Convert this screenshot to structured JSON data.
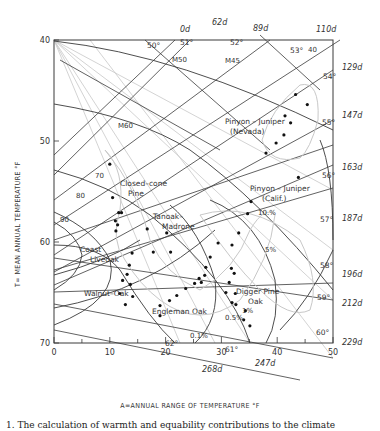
{
  "chart_data": {
    "type": "scatter",
    "title": "",
    "xlabel": "A=ANNUAL RANGE OF TEMPERATURE °F",
    "ylabel": "T= MEAN ANNUAL TEMPERATURE °F",
    "xlim": [
      0,
      50
    ],
    "ylim": [
      70,
      40
    ],
    "y_inverted": true,
    "x_ticks": [
      0,
      10,
      20,
      30,
      40,
      50
    ],
    "y_ticks": [
      40,
      50,
      60,
      70
    ],
    "grid": false,
    "legend": null,
    "series": [
      {
        "name": "Pinyon–Juniper (Nevada)",
        "points": [
          [
            43.3,
            45.4
          ],
          [
            45.4,
            46.4
          ],
          [
            41.4,
            47.5
          ],
          [
            42.4,
            48.2
          ],
          [
            41.2,
            49.4
          ],
          [
            39.8,
            50.2
          ],
          [
            38.0,
            51.2
          ],
          [
            43.8,
            53.6
          ]
        ]
      },
      {
        "name": "Closed-cone Pine",
        "points": [
          [
            10.0,
            52.3
          ],
          [
            10.5,
            55.6
          ]
        ]
      },
      {
        "name": "Coast Liveoak",
        "points": [
          [
            11.6,
            57.1
          ],
          [
            12.1,
            57.1
          ],
          [
            11.0,
            57.9
          ],
          [
            11.4,
            58.3
          ],
          [
            11.1,
            58.9
          ]
        ]
      },
      {
        "name": "Tanoak–Madrone",
        "points": [
          [
            16.7,
            58.7
          ],
          [
            20.2,
            59.1
          ],
          [
            17.8,
            61.0
          ],
          [
            20.9,
            61.0
          ],
          [
            14.0,
            61.1
          ]
        ]
      },
      {
        "name": "Walnut–Oak",
        "points": [
          [
            13.5,
            62.3
          ],
          [
            13.1,
            63.2
          ],
          [
            12.3,
            63.8
          ],
          [
            13.7,
            64.2
          ],
          [
            11.8,
            65.1
          ],
          [
            14.1,
            65.4
          ],
          [
            12.8,
            66.2
          ]
        ]
      },
      {
        "name": "Engleman Oak",
        "points": [
          [
            20.7,
            65.8
          ],
          [
            22.0,
            65.3
          ],
          [
            23.6,
            64.6
          ],
          [
            25.2,
            64.1
          ],
          [
            26.0,
            63.6
          ],
          [
            19.0,
            66.3
          ],
          [
            19.0,
            67.3
          ]
        ]
      },
      {
        "name": "Pinyon–Juniper (Calif.)",
        "points": [
          [
            35.3,
            56.0
          ],
          [
            34.7,
            57.2
          ],
          [
            33.1,
            59.1
          ],
          [
            29.4,
            60.1
          ],
          [
            31.9,
            60.3
          ],
          [
            28.0,
            61.5
          ],
          [
            27.2,
            62.5
          ],
          [
            27.0,
            63.3
          ],
          [
            26.4,
            64.0
          ]
        ]
      },
      {
        "name": "Digger Pine Oak",
        "points": [
          [
            31.8,
            62.6
          ],
          [
            32.3,
            63.1
          ],
          [
            31.4,
            64.0
          ],
          [
            30.8,
            65.0
          ],
          [
            32.5,
            65.1
          ],
          [
            31.9,
            66.0
          ],
          [
            32.6,
            66.2
          ],
          [
            34.3,
            66.8
          ],
          [
            34.0,
            67.7
          ],
          [
            35.1,
            68.3
          ]
        ]
      }
    ],
    "annotations": {
      "region_labels": [
        "Pinyon–Juniper (Nevada)",
        "Closed-cone Pine",
        "Tanoak–Madrone",
        "Pinyon–Juniper (Calif.)",
        "Coast Liveoak",
        "Walnut–Oak",
        "Engleman Oak",
        "Digger Pine Oak"
      ],
      "latitude_labels": [
        "50°",
        "51°",
        "52°",
        "53°",
        "54°",
        "55°",
        "56°",
        "57°",
        "58°",
        "59°",
        "60°",
        "61°",
        "62°"
      ],
      "daylength_labels": [
        "0d",
        "62d",
        "89d",
        "110d",
        "129d",
        "147d",
        "163d",
        "187d",
        "196d",
        "212d",
        "229d",
        "247d",
        "268d"
      ],
      "warmth_contours": [
        "M45",
        "M50",
        "M60",
        "70",
        "80",
        "90"
      ],
      "equability_labels": [
        "40",
        "10.%",
        "5%",
        "1%",
        "0.5%",
        "0.1%"
      ]
    }
  },
  "page": {
    "caption": "1. The calculation of warmth and equability contributions to the climate"
  }
}
